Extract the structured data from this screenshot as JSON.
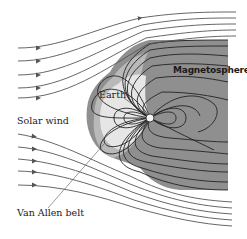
{
  "diagram": {
    "labels": {
      "magnetosphere": "Magnetosphere",
      "earth": "Earth",
      "solar_wind": "Solar wind",
      "van_allen_belt": "Van Allen belt"
    },
    "colors": {
      "outer_magnetosphere": "#8f8f8f",
      "middle_region": "#b9b9b9",
      "inner_region": "#e6e6e6",
      "field_lines": "#222222",
      "wind_lines": "#555555",
      "background": "#ffffff"
    }
  }
}
